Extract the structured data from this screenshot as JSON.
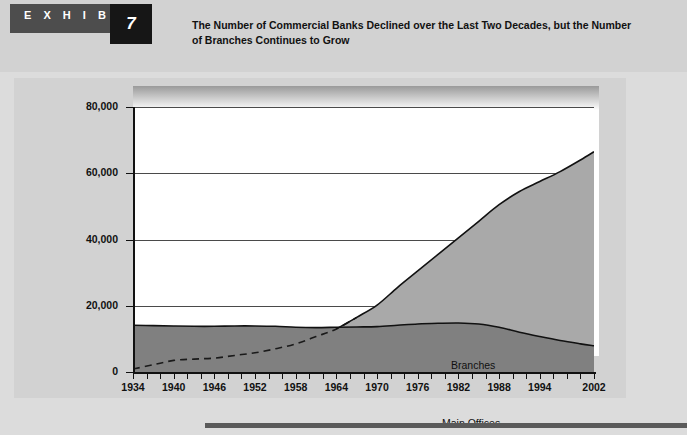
{
  "header": {
    "exhibit_word": "E X H I B I T",
    "exhibit_number": "7",
    "title": "The Number of Commercial Banks Declined over the Last Two Decades, but the Number of Branches Continues to Grow"
  },
  "colors": {
    "page_background": "#dcdcdc",
    "header_band": "#d2d2d2",
    "exhibit_tag": "#4d4d4d",
    "exhibit_number_box": "#161616",
    "plot_background": "#ffffff",
    "main_offices_fill": "#808080",
    "branches_fill": "#a9a9a9",
    "axis": "#111111",
    "gridline": "#4a4a4a",
    "footer_bar": "#5a5a5a"
  },
  "chart_data": {
    "type": "area",
    "title": "The Number of Commercial Banks Declined over the Last Two Decades, but the Number of Branches Continues to Grow",
    "xlabel": "",
    "ylabel": "",
    "grid": true,
    "gridlines_horizontal": true,
    "legend_position": "inline-annotation",
    "stacked": false,
    "ylim": [
      0,
      80000
    ],
    "xlim": [
      1934,
      2002
    ],
    "ytick_labels": [
      "0",
      "20,000",
      "40,000",
      "60,000",
      "80,000"
    ],
    "ytick_values": [
      0,
      20000,
      40000,
      60000,
      80000
    ],
    "xtick_labels": [
      "1934",
      "1940",
      "1946",
      "1952",
      "1958",
      "1964",
      "1970",
      "1976",
      "1982",
      "1988",
      "1994",
      "2002"
    ],
    "xtick_values": [
      1934,
      1940,
      1946,
      1952,
      1958,
      1964,
      1970,
      1976,
      1982,
      1988,
      1994,
      2002
    ],
    "x": [
      1934,
      1937,
      1940,
      1943,
      1946,
      1949,
      1952,
      1955,
      1958,
      1961,
      1964,
      1967,
      1970,
      1973,
      1976,
      1979,
      1982,
      1985,
      1988,
      1991,
      1994,
      1997,
      2000,
      2002
    ],
    "series": [
      {
        "name": "Main Offices",
        "label": "Main Offices",
        "style": "solid-filled-area",
        "fill": "#808080",
        "values": [
          14100,
          14000,
          13900,
          13800,
          13800,
          13900,
          13900,
          13800,
          13500,
          13400,
          13500,
          13600,
          13700,
          14100,
          14500,
          14700,
          14800,
          14500,
          13500,
          12000,
          10700,
          9500,
          8500,
          7900
        ]
      },
      {
        "name": "Branches",
        "label": "Branches",
        "style": "dashed-where-below-main-offices",
        "fill": "#a9a9a9",
        "values": [
          900,
          2200,
          3500,
          3900,
          4200,
          5000,
          5800,
          7000,
          8500,
          10700,
          13000,
          16500,
          20200,
          25500,
          30500,
          35500,
          40500,
          45500,
          50500,
          54500,
          57500,
          60500,
          64000,
          66500
        ]
      }
    ],
    "annotations": [
      {
        "text": "Branches",
        "x": 1983,
        "y": 33000
      },
      {
        "text": "Main Offices",
        "x": 1982,
        "y": 9000
      }
    ]
  },
  "footer": {
    "bar": ""
  }
}
